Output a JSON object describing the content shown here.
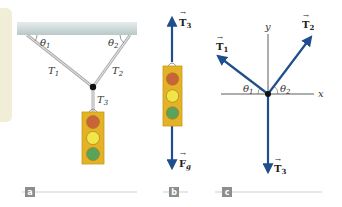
{
  "panels": [
    {
      "id": "a",
      "tag": "a",
      "labels": {
        "theta1": "θ",
        "theta1_sub": "1",
        "theta2": "θ",
        "theta2_sub": "2",
        "T1": "T",
        "T1_sub": "1",
        "T2": "T",
        "T2_sub": "2",
        "T3": "T",
        "T3_sub": "3"
      }
    },
    {
      "id": "b",
      "tag": "b",
      "labels": {
        "T3": "T",
        "T3_sub": "3",
        "Fg": "F",
        "Fg_sub": "g"
      }
    },
    {
      "id": "c",
      "tag": "c",
      "labels": {
        "T1": "T",
        "T1_sub": "1",
        "T2": "T",
        "T2_sub": "2",
        "T3": "T",
        "T3_sub": "3",
        "theta1": "θ",
        "theta1_sub": "1",
        "theta2": "θ",
        "theta2_sub": "2",
        "y_axis": "y",
        "x_axis": "x"
      }
    }
  ],
  "colors": {
    "vector": "#1f4e8c",
    "cable": "#b5b5b5",
    "ceiling": "#c9d6d6",
    "light_housing": "#e3b226",
    "red_light": "#c9643a",
    "yellow_light": "#f0e64a",
    "green_light": "#5aa35a",
    "tag_bg": "#8a8f8a",
    "beige_panel": "#f1eed7"
  }
}
